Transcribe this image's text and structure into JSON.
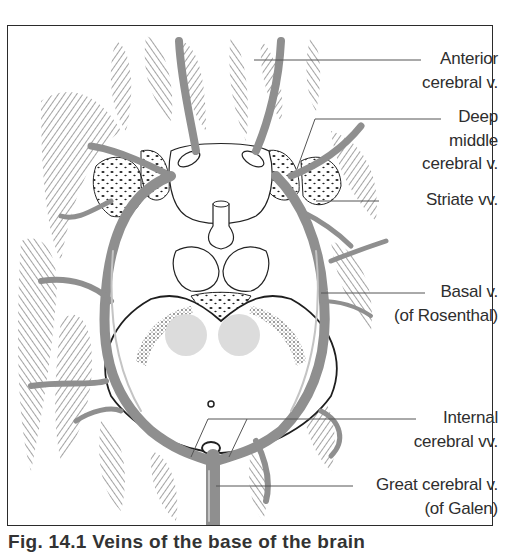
{
  "figure": {
    "colors": {
      "vein": "#8f8f8f",
      "vein_highlight": "#c4c4c4",
      "hatching": "#2a2a2a",
      "frame": "#2b2b2b",
      "leader_line": "#555555",
      "nucleus_shading": "#dcdcdc"
    },
    "labels": [
      {
        "id": "anterior-cerebral-v",
        "lines": [
          "Anterior",
          "cerebral v."
        ]
      },
      {
        "id": "deep-middle-cerebral-v",
        "lines": [
          "Deep",
          "middle",
          "cerebral v."
        ]
      },
      {
        "id": "striate-vv",
        "lines": [
          "Striate vv."
        ]
      },
      {
        "id": "basal-v",
        "lines": [
          "Basal v.",
          "(of Rosenthal)"
        ]
      },
      {
        "id": "internal-cerebral-vv",
        "lines": [
          "Internal",
          "cerebral vv."
        ]
      },
      {
        "id": "great-cerebral-v",
        "lines": [
          "Great cerebral v.",
          "(of Galen)"
        ]
      }
    ],
    "caption_fragment": "Fig. 14.1  Veins of the base of the brain"
  }
}
